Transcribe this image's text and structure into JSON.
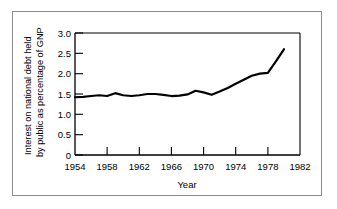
{
  "chart_data": {
    "type": "line",
    "title": "",
    "xlabel": "Year",
    "ylabel": "Interest on national debt held by public as percentage of GNP",
    "ylabel_line1": "Interest on national debt held",
    "ylabel_line2": "by public as percentage of GNP",
    "xlim": [
      1954,
      1982
    ],
    "ylim": [
      0,
      3.0
    ],
    "grid": false,
    "legend": "none",
    "xticks": [
      1954,
      1958,
      1962,
      1966,
      1970,
      1974,
      1978,
      1982
    ],
    "xtick_labels": [
      "1954",
      "1958",
      "1962",
      "1966",
      "1970",
      "1974",
      "1978",
      "1982"
    ],
    "yticks": [
      0,
      0.5,
      1.0,
      1.5,
      2.0,
      2.5,
      3.0
    ],
    "ytick_labels": [
      "0",
      "0.5",
      "1.0",
      "1.5",
      "2.0",
      "2.5",
      "3.0"
    ],
    "line_color": "#000000",
    "x": [
      1954,
      1955,
      1956,
      1957,
      1958,
      1959,
      1960,
      1961,
      1962,
      1963,
      1964,
      1965,
      1966,
      1967,
      1968,
      1969,
      1970,
      1971,
      1972,
      1973,
      1974,
      1975,
      1976,
      1977,
      1978,
      1979,
      1980
    ],
    "values": [
      1.42,
      1.43,
      1.45,
      1.47,
      1.45,
      1.52,
      1.47,
      1.45,
      1.47,
      1.5,
      1.5,
      1.48,
      1.45,
      1.46,
      1.49,
      1.58,
      1.54,
      1.48,
      1.56,
      1.65,
      1.75,
      1.85,
      1.95,
      2.0,
      2.02,
      2.3,
      2.6
    ]
  }
}
